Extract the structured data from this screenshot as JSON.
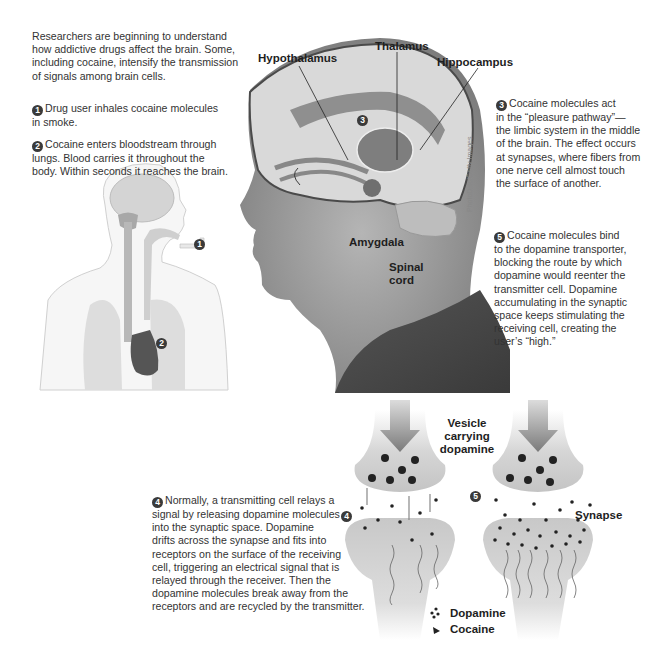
{
  "intro": {
    "line1": "Researchers are beginning to understand",
    "line2": "how addictive drugs affect the brain. Some,",
    "line3": "including cocaine, intensify the transmission",
    "line4": "of signals among brain cells."
  },
  "steps": {
    "s1": {
      "num": "1",
      "line1": "Drug user inhales cocaine molecules",
      "line2": "in smoke."
    },
    "s2": {
      "num": "2",
      "line1": "Cocaine enters bloodstream through",
      "line2": "lungs. Blood carries it throughout the",
      "line3": "body. Within seconds it reaches the brain."
    },
    "s3": {
      "num": "3",
      "line1": "Cocaine molecules act",
      "line2": "in the “pleasure pathway”—",
      "line3": "the limbic system in the middle",
      "line4": "of the brain. The effect occurs",
      "line5": "at synapses, where fibers from",
      "line6": "one nerve cell almost touch",
      "line7": "the surface of another."
    },
    "s4": {
      "num": "4",
      "line1": "Normally, a transmitting cell relays a",
      "line2": "signal by releasing dopamine molecules",
      "line3": "into the synaptic space. Dopamine",
      "line4": "drifts across the synapse and fits into",
      "line5": "receptors on the surface of the receiving",
      "line6": "cell, triggering an electrical signal that is",
      "line7": "relayed through the receiver. Then the",
      "line8": "dopamine molecules break away from the",
      "line9": "receptors and are recycled by the transmitter."
    },
    "s5": {
      "num": "5",
      "line1": "Cocaine molecules bind",
      "line2": "to the dopamine transporter,",
      "line3": "blocking the route by which",
      "line4": "dopamine would reenter the",
      "line5": "transmitter cell. Dopamine",
      "line6": "accumulating in the synaptic",
      "line7": "space keeps stimulating the",
      "line8": "receiving cell, creating the",
      "line9": "user’s “high.”"
    }
  },
  "brain_labels": {
    "hypothalamus": "Hypothalamus",
    "thalamus": "Thalamus",
    "hippocampus": "Hippocampus",
    "amygdala": "Amygdala",
    "spinal1": "Spinal",
    "spinal2": "cord"
  },
  "synapse_labels": {
    "vesicle1": "Vesicle",
    "vesicle2": "carrying",
    "vesicle3": "dopamine",
    "synapse": "Synapse",
    "marker4": "4",
    "marker5": "5"
  },
  "legend": {
    "dopamine": "Dopamine",
    "cocaine": "Cocaine"
  },
  "credit": "PhotoDisc/Getty Images",
  "markers": {
    "m1": "1",
    "m2": "2",
    "m3": "3"
  },
  "colors": {
    "skin": "#9a9a9a",
    "shirt": "#4a4a4a",
    "brain": "#cfcfcf",
    "limbic": "#8c8c8c",
    "cell": "#d8d8d8",
    "dot": "#222222"
  }
}
